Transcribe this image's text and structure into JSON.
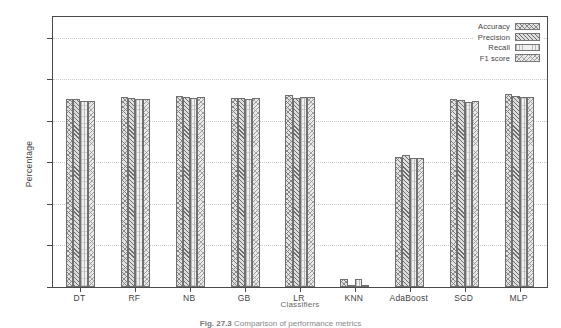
{
  "figure": {
    "caption_prefix": "Fig. 27.3",
    "caption_text": "Comparison of performance metrics"
  },
  "axes": {
    "y_title": "Percentage",
    "x_title": "Classifiers",
    "y_ticks": [
      "0",
      "20",
      "40",
      "60",
      "80",
      "100",
      "120"
    ]
  },
  "legend": {
    "items": [
      {
        "label": "Accuracy",
        "pattern": "cross-hatch-dense"
      },
      {
        "label": "Precision",
        "pattern": "diagonal-hatch"
      },
      {
        "label": "Recall",
        "pattern": "sparse-dots"
      },
      {
        "label": "F1 score",
        "pattern": "cross-hatch-light"
      }
    ]
  },
  "chart_data": {
    "type": "bar",
    "title": "",
    "xlabel": "Classifiers",
    "ylabel": "Percentage",
    "ylim": [
      0,
      130
    ],
    "yticks": [
      0,
      20,
      40,
      60,
      80,
      100,
      120
    ],
    "grid": true,
    "legend_position": "top-right",
    "categories": [
      "DT",
      "RF",
      "NB",
      "GB",
      "LR",
      "KNN",
      "AdaBoost",
      "SGD",
      "MLP"
    ],
    "series": [
      {
        "name": "Accuracy",
        "values": [
          90.5,
          91.6,
          91.8,
          91.2,
          92.6,
          3.8,
          62.5,
          90.4,
          92.8
        ]
      },
      {
        "name": "Precision",
        "values": [
          90.3,
          91.0,
          91.4,
          90.8,
          91.2,
          0.3,
          63.4,
          90.0,
          92.0
        ]
      },
      {
        "name": "Recall",
        "values": [
          89.6,
          90.4,
          91.2,
          90.6,
          91.4,
          4.0,
          62.0,
          89.2,
          91.4
        ]
      },
      {
        "name": "F1 score",
        "values": [
          89.8,
          90.6,
          91.3,
          90.9,
          91.5,
          0.4,
          62.2,
          89.4,
          91.6
        ]
      }
    ]
  }
}
